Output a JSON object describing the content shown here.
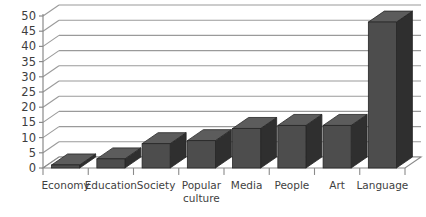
{
  "chart_data": {
    "type": "bar",
    "title": "",
    "subtitle": "",
    "xlabel": "",
    "ylabel": "",
    "categories": [
      "Economy",
      "Education",
      "Society",
      "Popular culture",
      "Media",
      "People",
      "Art",
      "Language"
    ],
    "values": [
      1,
      3,
      8,
      9,
      13,
      14,
      14,
      48
    ],
    "ylim": [
      0,
      50
    ],
    "yticks": [
      0,
      5,
      10,
      15,
      20,
      25,
      30,
      35,
      40,
      45,
      50
    ],
    "ytick_labels": [
      "0",
      "5",
      "10",
      "15",
      "20",
      "25",
      "30",
      "35",
      "40",
      "45",
      "50"
    ],
    "grid": true,
    "grid_axis": "y",
    "legend": false,
    "legend_position": "none",
    "style": "3d-column",
    "series": [
      {
        "name": "Count",
        "values": [
          1,
          3,
          8,
          9,
          13,
          14,
          14,
          48
        ]
      }
    ],
    "colors": {
      "bar_front": "#4d4d4d",
      "bar_side": "#2f2f2f",
      "bar_top": "#5c5c5c",
      "bar_outline": "#262626",
      "gridline": "#9a9a9a",
      "axis": "#8a8a8a",
      "floor": "#ffffff",
      "background": "#ffffff",
      "tick_text": "#3d3d3d",
      "category_text": "#3f3f3f"
    }
  }
}
